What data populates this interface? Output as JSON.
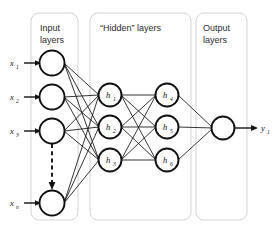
{
  "diagram": {
    "type": "neural-network-architecture",
    "background_color": "#ffffff",
    "stroke_color": "#111111",
    "box_stroke_color": "#d3d3d3",
    "groups": [
      {
        "id": "input",
        "title_line1": "Input",
        "title_line2": "layers"
      },
      {
        "id": "hidden",
        "title_line1": "“Hidden” layers",
        "title_line2": ""
      },
      {
        "id": "output",
        "title_line1": "Output",
        "title_line2": "layers"
      }
    ],
    "input_layer": {
      "node_count": 4,
      "labels": [
        {
          "base": "x",
          "sub": "1"
        },
        {
          "base": "x",
          "sub": "2"
        },
        {
          "base": "x",
          "sub": "3"
        },
        {
          "base": "x",
          "sub": "n"
        }
      ],
      "ellipsis_marker": "dashed-vertical-arrow"
    },
    "hidden_layer_1": {
      "node_count": 3,
      "labels": [
        {
          "base": "h",
          "sub": "1"
        },
        {
          "base": "h",
          "sub": "2"
        },
        {
          "base": "h",
          "sub": "3"
        }
      ]
    },
    "hidden_layer_2": {
      "node_count": 3,
      "labels": [
        {
          "base": "h",
          "sub": "4"
        },
        {
          "base": "h",
          "sub": "5"
        },
        {
          "base": "h",
          "sub": "6"
        }
      ]
    },
    "output_layer": {
      "node_count": 1,
      "labels": [
        {
          "base": "y",
          "sub": "1"
        }
      ]
    },
    "connections": {
      "input_to_hidden1": "fully-connected",
      "hidden1_to_hidden2": "fully-connected",
      "hidden2_to_output": "fully-connected"
    }
  }
}
